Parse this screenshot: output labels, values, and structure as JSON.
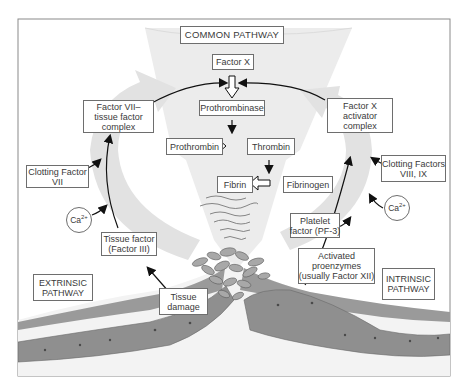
{
  "diagram": {
    "common_pathway": {
      "heading": "COMMON PATHWAY",
      "steps": {
        "factor_x": "Factor X",
        "prothrombinase": "Prothrombinase",
        "prothrombin": "Prothrombin",
        "thrombin": "Thrombin",
        "fibrin": "Fibrin",
        "fibrinogen": "Fibrinogen"
      }
    },
    "extrinsic": {
      "heading_line1": "EXTRINSIC",
      "heading_line2": "PATHWAY",
      "tissue_damage_line1": "Tissue",
      "tissue_damage_line2": "damage",
      "tissue_factor_line1": "Tissue factor",
      "tissue_factor_line2": "(Factor III)",
      "calcium": "Ca",
      "calcium_charge": "2+",
      "clotting_factor_line1": "Clotting Factor",
      "clotting_factor_line2": "VII",
      "complex_line1": "Factor VII–",
      "complex_line2": "tissue factor",
      "complex_line3": "complex"
    },
    "intrinsic": {
      "heading_line1": "INTRINSIC",
      "heading_line2": "PATHWAY",
      "proenzymes_line1": "Activated",
      "proenzymes_line2": "proenzymes",
      "proenzymes_line3": "(usually Factor XII)",
      "platelet_line1": "Platelet",
      "platelet_line2": "factor (PF-3)",
      "calcium": "Ca",
      "calcium_charge": "2+",
      "clotting_factors_line1": "Clotting Factors",
      "clotting_factors_line2": "VIII, IX",
      "complex_line1": "Factor X",
      "complex_line2": "activator",
      "complex_line3": "complex"
    },
    "colors": {
      "frame": "#8a8a8a",
      "band_fill": "#e4e4e4",
      "funnel_fill": "#ececec",
      "tissue_dark": "#8c8c8c",
      "tissue_light": "#d9d9d9",
      "arrow": "#111111"
    }
  }
}
